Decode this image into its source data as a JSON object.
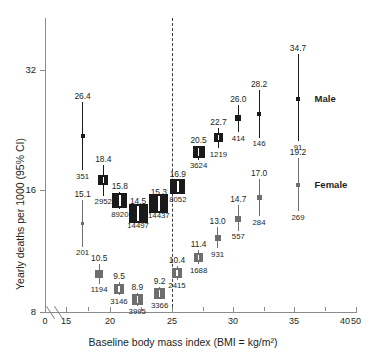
{
  "chart_data": {
    "type": "scatter",
    "title": "",
    "xlabel": "Baseline body mass index  (BMI = kg/m²)",
    "ylabel": "Yearly deaths per 1000 (95% CI)",
    "yscale": "log2",
    "ylim": [
      8,
      38
    ],
    "ytick_labels": [
      "8",
      "16",
      "32"
    ],
    "ytick_values": [
      8,
      16,
      32
    ],
    "xlim": [
      15,
      50
    ],
    "xtick_labels": [
      "0",
      "15",
      "20",
      "25",
      "30",
      "35",
      "40",
      "50"
    ],
    "xtick_values": [
      0,
      15,
      20,
      25,
      30,
      35,
      40,
      50
    ],
    "x_axis_break": true,
    "grid": false,
    "reference_line_x": 25,
    "legend_position": "right-inline",
    "series": [
      {
        "name": "Male",
        "color": "#1a1a1a",
        "points": [
          {
            "x": 17.0,
            "y": 21.8,
            "label": "26.4",
            "n": "351",
            "ci_low": 17.9,
            "ci_high": 26.4,
            "marker_size": 4
          },
          {
            "x": 19.5,
            "y": 16.9,
            "label": "18.4",
            "n": "2952",
            "ci_low": 15.5,
            "ci_high": 18.4,
            "marker_size": 10
          },
          {
            "x": 21.5,
            "y": 15.1,
            "label": "15.8",
            "n": "8920",
            "ci_low": 14.4,
            "ci_high": 15.8,
            "marker_size": 15
          },
          {
            "x": 23.7,
            "y": 14.0,
            "label": "14.5",
            "n": "14497",
            "ci_low": 13.5,
            "ci_high": 14.5,
            "marker_size": 19
          },
          {
            "x": 26.2,
            "y": 14.8,
            "label": "15.3",
            "n": "14437",
            "ci_low": 14.3,
            "ci_high": 15.3,
            "marker_size": 19
          },
          {
            "x": 28.5,
            "y": 16.3,
            "label": "16.9",
            "n": "8052",
            "ci_low": 15.7,
            "ci_high": 16.9,
            "marker_size": 15
          },
          {
            "x": 31.0,
            "y": 19.8,
            "label": "20.5",
            "n": "3624",
            "ci_low": 19.0,
            "ci_high": 20.5,
            "marker_size": 12
          },
          {
            "x": 33.4,
            "y": 21.5,
            "label": "22.7",
            "n": "1219",
            "ci_low": 20.3,
            "ci_high": 22.7,
            "marker_size": 9
          },
          {
            "x": 35.8,
            "y": 24.1,
            "label": "26.0",
            "n": "414",
            "ci_low": 22.2,
            "ci_high": 26.0,
            "marker_size": 6
          },
          {
            "x": 38.3,
            "y": 24.7,
            "label": "28.2",
            "n": "146",
            "ci_low": 21.5,
            "ci_high": 28.2,
            "marker_size": 4
          },
          {
            "x": 43.0,
            "y": 26.9,
            "label": "34.7",
            "n": "91",
            "ci_low": 21.1,
            "ci_high": 34.7,
            "marker_size": 4
          }
        ]
      },
      {
        "name": "Female",
        "color": "#6e6e6e",
        "points": [
          {
            "x": 17.0,
            "y": 13.2,
            "label": "15.1",
            "n": "201",
            "ci_low": 11.6,
            "ci_high": 15.1,
            "marker_size": 3
          },
          {
            "x": 19.0,
            "y": 9.9,
            "label": "10.5",
            "n": "1194",
            "ci_low": 9.4,
            "ci_high": 10.5,
            "marker_size": 8
          },
          {
            "x": 21.4,
            "y": 9.1,
            "label": "9.5",
            "n": "3146",
            "ci_low": 8.8,
            "ci_high": 9.5,
            "marker_size": 10
          },
          {
            "x": 23.6,
            "y": 8.6,
            "label": "8.9",
            "n": "3995",
            "ci_low": 8.3,
            "ci_high": 8.9,
            "marker_size": 11
          },
          {
            "x": 26.3,
            "y": 8.9,
            "label": "9.2",
            "n": "3366",
            "ci_low": 8.6,
            "ci_high": 9.2,
            "marker_size": 11
          },
          {
            "x": 28.4,
            "y": 10.0,
            "label": "10.4",
            "n": "2415",
            "ci_low": 9.6,
            "ci_high": 10.4,
            "marker_size": 10
          },
          {
            "x": 31.0,
            "y": 10.9,
            "label": "11.4",
            "n": "1688",
            "ci_low": 10.5,
            "ci_high": 11.4,
            "marker_size": 9
          },
          {
            "x": 33.3,
            "y": 12.2,
            "label": "13.0",
            "n": "931",
            "ci_low": 11.5,
            "ci_high": 13.0,
            "marker_size": 6
          },
          {
            "x": 35.8,
            "y": 13.6,
            "label": "14.7",
            "n": "557",
            "ci_low": 12.7,
            "ci_high": 14.7,
            "marker_size": 6
          },
          {
            "x": 38.3,
            "y": 15.3,
            "label": "17.0",
            "n": "284",
            "ci_low": 13.8,
            "ci_high": 17.0,
            "marker_size": 5
          },
          {
            "x": 43.0,
            "y": 16.5,
            "label": "19.2",
            "n": "269",
            "ci_low": 14.2,
            "ci_high": 19.2,
            "marker_size": 4
          }
        ]
      }
    ],
    "annotations": [
      {
        "text": "Male",
        "x": 45.0,
        "y": 26.9
      },
      {
        "text": "Female",
        "x": 45.0,
        "y": 16.5
      }
    ]
  }
}
